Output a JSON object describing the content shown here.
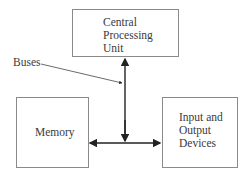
{
  "diagram": {
    "nodes": [
      {
        "id": "cpu",
        "lines": [
          "Central",
          "Processing",
          "Unit"
        ]
      },
      {
        "id": "memory",
        "lines": [
          "Memory"
        ]
      },
      {
        "id": "io",
        "lines": [
          "Input and",
          "Output",
          "Devices"
        ]
      }
    ],
    "callout": {
      "label": "Buses"
    },
    "edges": [
      {
        "from": "bus-junction",
        "to": "cpu",
        "arrow": "both"
      },
      {
        "from": "bus-junction",
        "to": "memory",
        "arrow": "end"
      },
      {
        "from": "bus-junction",
        "to": "io",
        "arrow": "end"
      }
    ],
    "colors": {
      "stroke": "#222222",
      "box_border": "#8a8a8a",
      "text": "#3a3a3a"
    }
  }
}
